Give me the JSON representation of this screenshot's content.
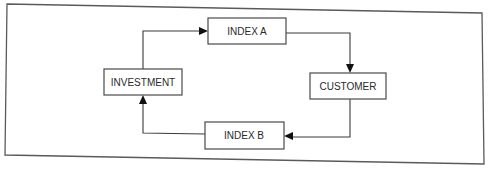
{
  "diagram": {
    "type": "cycle-flowchart",
    "nodes": [
      {
        "id": "investment",
        "label": "INVESTMENT"
      },
      {
        "id": "index_a",
        "label": "INDEX A"
      },
      {
        "id": "customer",
        "label": "CUSTOMER"
      },
      {
        "id": "index_b",
        "label": "INDEX B"
      }
    ],
    "edges": [
      {
        "from": "investment",
        "to": "index_a"
      },
      {
        "from": "index_a",
        "to": "customer"
      },
      {
        "from": "customer",
        "to": "index_b"
      },
      {
        "from": "index_b",
        "to": "investment"
      }
    ]
  },
  "colors": {
    "background": "#ffffff",
    "stroke": "#4a4a4a",
    "text": "#2a2a2a",
    "arrow": "#111111"
  }
}
